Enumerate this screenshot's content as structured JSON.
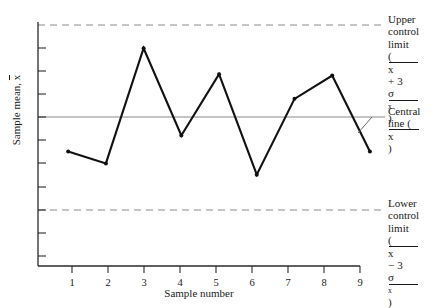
{
  "chart_data": {
    "type": "line",
    "title": "",
    "xlabel": "Sample number",
    "ylabel": "Sample mean, x̄",
    "categories": [
      "1",
      "2",
      "3",
      "4",
      "5",
      "6",
      "7",
      "8",
      "9"
    ],
    "x": [
      1,
      2,
      3,
      4,
      5,
      6,
      7,
      8,
      9
    ],
    "series": [
      {
        "name": "Sample mean",
        "values": [
          -0.42,
          -0.6,
          1.13,
          -0.18,
          0.74,
          -0.77,
          0.37,
          0.72,
          -0.42
        ]
      }
    ],
    "ylim": [
      -1.3,
      1.48
    ],
    "xlim": [
      0.2,
      9.4
    ],
    "grid": false,
    "legend": "none",
    "y_axis_ticks_labeled": false,
    "y_tick_count": 11,
    "reference_lines": [
      {
        "name": "upper-control-limit",
        "value": 1.48,
        "style": "dashed",
        "color": "#8a8a8a"
      },
      {
        "name": "central-line",
        "value": 0.0,
        "style": "solid",
        "color": "#8a8a8a"
      },
      {
        "name": "lower-control-limit",
        "value": -1.48,
        "style": "dashed",
        "color": "#8a8a8a"
      }
    ],
    "annotations": {
      "upper": {
        "line1": "Upper",
        "line2": "control",
        "line3": "limit",
        "formula_open": "(",
        "formula_mean": "x",
        "formula_op": " + 3",
        "formula_sigma": "σ",
        "formula_sub": "x",
        "formula_close": ")"
      },
      "central": {
        "line1": "Central",
        "line2_pre": "line (",
        "line2_mean": "x",
        "line2_post": ")"
      },
      "lower": {
        "line1": "Lower",
        "line2": "control",
        "line3": "limit",
        "formula_open": "(",
        "formula_mean": "x",
        "formula_op": " − 3",
        "formula_sigma": "σ",
        "formula_sub": "x",
        "formula_close": ")"
      }
    },
    "marker": {
      "shape": "circle",
      "color": "#111111",
      "size_px": 4
    },
    "line_color": "#111111"
  },
  "colors": {
    "axis": "#2b2b2b",
    "limit": "#8a8a8a",
    "series": "#111111",
    "background": "#ffffff"
  }
}
